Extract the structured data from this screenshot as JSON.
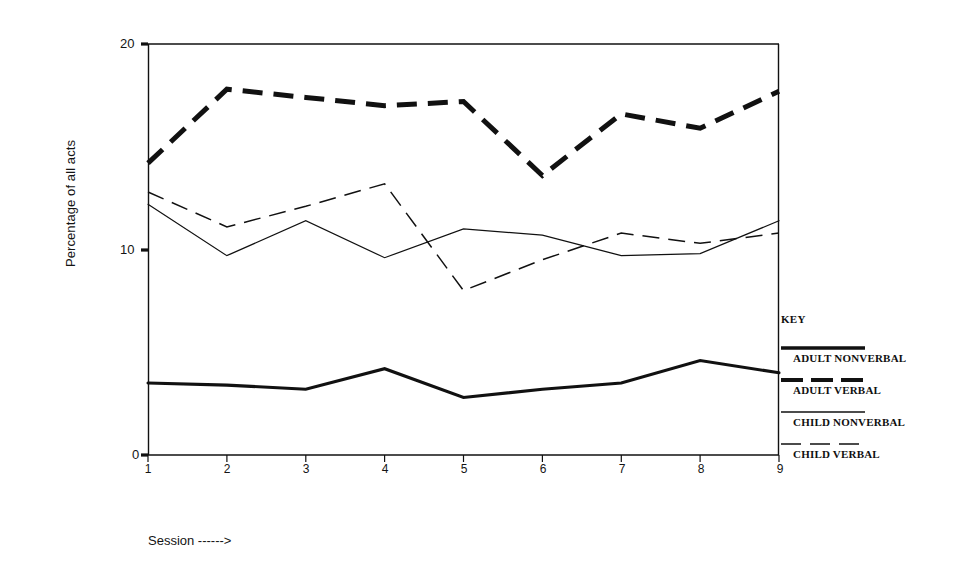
{
  "figure": {
    "top_fragment_left": "g",
    "top_fragment_right": "y"
  },
  "axes": {
    "y_axis_title": "Percentage of all acts",
    "y_ticks": [
      "20",
      "10",
      "0"
    ],
    "x_ticks": [
      "1",
      "2",
      "3",
      "4",
      "5",
      "6",
      "7",
      "8",
      "9"
    ],
    "x_axis_title": "Session ------>"
  },
  "key": {
    "title": "KEY",
    "entries": [
      {
        "label": "ADULT NONVERBAL",
        "style": "thick-solid"
      },
      {
        "label": "ADULT VERBAL",
        "style": "thick-dashed"
      },
      {
        "label": "CHILD NONVERBAL",
        "style": "thin-solid"
      },
      {
        "label": "CHILD VERBAL",
        "style": "thin-dashed"
      }
    ]
  },
  "chart_data": {
    "type": "line",
    "title": "",
    "xlabel": "Session ------>",
    "ylabel": "Percentage of all acts",
    "x": [
      1,
      2,
      3,
      4,
      5,
      6,
      7,
      8,
      9
    ],
    "xlim": [
      1,
      9
    ],
    "ylim": [
      0,
      20
    ],
    "yticks": [
      0,
      10,
      20
    ],
    "grid": false,
    "legend_position": "right",
    "series": [
      {
        "name": "ADULT NONVERBAL",
        "style": "thick-dashed",
        "values": [
          14.2,
          17.8,
          17.4,
          17.0,
          17.2,
          13.6,
          16.6,
          15.9,
          17.7
        ]
      },
      {
        "name": "ADULT VERBAL",
        "style": "thick-solid",
        "values": [
          3.5,
          3.4,
          3.2,
          4.2,
          2.8,
          3.2,
          3.5,
          4.6,
          4.0
        ]
      },
      {
        "name": "CHILD NONVERBAL",
        "style": "thin-solid",
        "values": [
          12.2,
          9.7,
          11.4,
          9.6,
          11.0,
          10.7,
          9.7,
          9.8,
          11.4
        ]
      },
      {
        "name": "CHILD VERBAL",
        "style": "thin-dashed",
        "values": [
          12.8,
          11.1,
          12.1,
          13.2,
          8.0,
          9.5,
          10.8,
          10.3,
          10.8
        ]
      }
    ]
  },
  "colors": {
    "ink": "#111111",
    "background": "#ffffff"
  }
}
